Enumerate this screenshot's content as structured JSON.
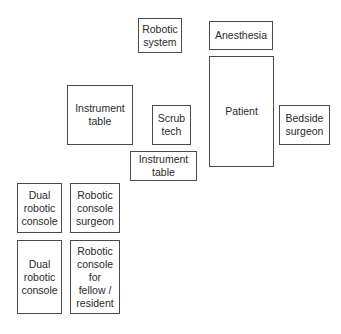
{
  "diagram": {
    "type": "operating-room-layout",
    "boxes": [
      {
        "id": "robotic-system",
        "label": "Robotic\nsystem"
      },
      {
        "id": "anesthesia",
        "label": "Anesthesia"
      },
      {
        "id": "patient",
        "label": "Patient"
      },
      {
        "id": "bedside-surgeon",
        "label": "Bedside\nsurgeon"
      },
      {
        "id": "instrument-table-large",
        "label": "Instrument\ntable"
      },
      {
        "id": "scrub-tech",
        "label": "Scrub\ntech"
      },
      {
        "id": "instrument-table-small",
        "label": "Instrument\ntable"
      },
      {
        "id": "dual-robotic-console-1",
        "label": "Dual\nrobotic\nconsole"
      },
      {
        "id": "robotic-console-surgeon",
        "label": "Robotic\nconsole\nsurgeon"
      },
      {
        "id": "dual-robotic-console-2",
        "label": "Dual\nrobotic\nconsole"
      },
      {
        "id": "robotic-console-fellow",
        "label": "Robotic\nconsole\nfor\nfellow /\nresident"
      }
    ]
  }
}
